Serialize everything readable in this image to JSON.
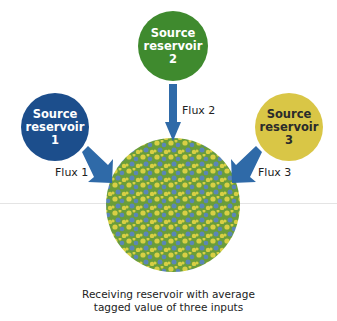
{
  "diagram": {
    "sources": [
      {
        "id": "1",
        "line1": "Source",
        "line2": "reservoir",
        "line3": "1",
        "color": "#1c4e8c"
      },
      {
        "id": "2",
        "line1": "Source",
        "line2": "reservoir",
        "line3": "2",
        "color": "#3f8a2e"
      },
      {
        "id": "3",
        "line1": "Source",
        "line2": "reservoir",
        "line3": "3",
        "color": "#d9c646"
      }
    ],
    "fluxes": [
      "Flux 1",
      "Flux 2",
      "Flux 3"
    ],
    "arrow_color": "#2f6aa8",
    "receiver": {
      "colors": [
        "#6a9d3a",
        "#d8cf44",
        "#5a86b8"
      ],
      "caption_line1": "Receiving reservoir with average",
      "caption_line2": "tagged value of three inputs"
    }
  }
}
